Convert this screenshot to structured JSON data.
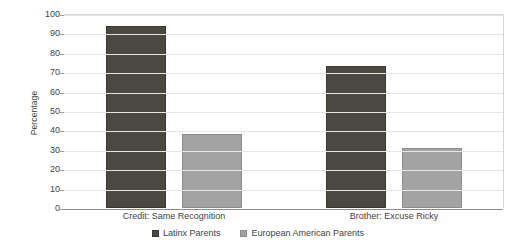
{
  "chart_data": {
    "type": "bar",
    "title": "",
    "xlabel": "",
    "ylabel": "Percentage",
    "ylim": [
      0,
      100
    ],
    "ytick_step": 10,
    "yticks": [
      100,
      90,
      80,
      70,
      60,
      50,
      40,
      30,
      20,
      10,
      0
    ],
    "grid": true,
    "legend_position": "bottom-center",
    "categories": [
      "Credit: Same Recognition",
      "Brother: Excuse Ricky"
    ],
    "series": [
      {
        "name": "Latinx Parents",
        "color": "#4b4741",
        "values": [
          94,
          73
        ]
      },
      {
        "name": "European American Parents",
        "color": "#a3a3a3",
        "values": [
          38,
          31
        ]
      }
    ]
  },
  "axes": {
    "y_title": "Percentage"
  }
}
